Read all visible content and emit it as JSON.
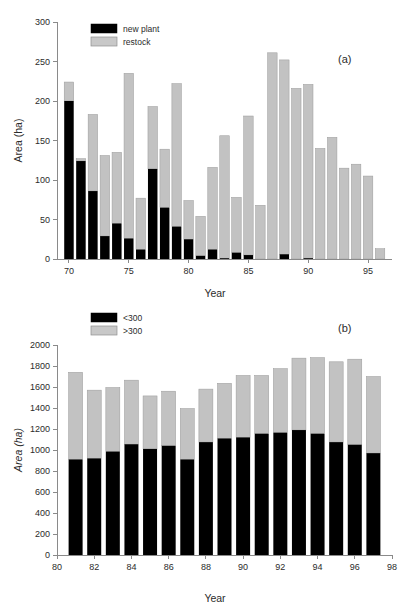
{
  "figure": {
    "background": "#ffffff",
    "bar_dark_color": "#000000",
    "bar_light_color": "#c2c2c2",
    "axis_color": "#8a8a8a"
  },
  "panel_a": {
    "label": "(a)",
    "legend": [
      {
        "name": "new plant",
        "color": "#000000"
      },
      {
        "name": "restock",
        "color": "#c2c2c2"
      }
    ]
  },
  "panel_b": {
    "label": "(b)",
    "legend": [
      {
        "name": "<300",
        "color": "#000000"
      },
      {
        "name": ">300",
        "color": "#c2c2c2"
      }
    ]
  },
  "chart_data": [
    {
      "type": "bar",
      "id": "panel-a",
      "stacked": true,
      "title": "",
      "panel_label": "(a)",
      "xlabel": "Year",
      "ylabel": "Area (ha)",
      "ylim": [
        0,
        300
      ],
      "yticks": [
        0,
        50,
        100,
        150,
        200,
        250,
        300
      ],
      "ytick_labels": [
        "0",
        "50",
        "100",
        "150",
        "200",
        "250",
        "300"
      ],
      "xlim": [
        69,
        97
      ],
      "xticks": [
        70,
        75,
        80,
        85,
        90,
        95
      ],
      "xtick_labels": [
        "70",
        "75",
        "80",
        "85",
        "90",
        "95"
      ],
      "grid": false,
      "legend_position": "top-left",
      "categories": [
        70,
        71,
        72,
        73,
        74,
        75,
        76,
        77,
        78,
        79,
        80,
        81,
        82,
        83,
        84,
        85,
        86,
        87,
        88,
        89,
        90,
        91,
        92,
        93,
        94,
        95,
        96
      ],
      "series": [
        {
          "name": "new plant",
          "color": "#000000",
          "values": [
            200,
            124,
            86,
            29,
            45,
            26,
            12,
            114,
            65,
            41,
            25,
            4,
            12,
            1,
            8,
            5,
            0,
            0,
            6,
            0,
            1,
            0,
            0,
            0,
            0,
            0,
            0
          ]
        },
        {
          "name": "restock",
          "color": "#c2c2c2",
          "values": [
            24,
            3,
            97,
            102,
            90,
            209,
            65,
            79,
            74,
            181,
            49,
            50,
            104,
            155,
            70,
            176,
            68,
            261,
            246,
            216,
            220,
            140,
            154,
            115,
            120,
            105,
            13
          ]
        }
      ],
      "totals": [
        224,
        127,
        183,
        131,
        135,
        235,
        77,
        193,
        139,
        222,
        74,
        54,
        116,
        156,
        78,
        181,
        68,
        261,
        252,
        216,
        221,
        140,
        154,
        115,
        120,
        105,
        13
      ]
    },
    {
      "type": "bar",
      "id": "panel-b",
      "stacked": true,
      "title": "",
      "panel_label": "(b)",
      "xlabel": "Year",
      "ylabel": "Area (ha)",
      "ylim": [
        0,
        2000
      ],
      "yticks": [
        0,
        200,
        400,
        600,
        800,
        1000,
        1200,
        1400,
        1600,
        1800,
        2000
      ],
      "ytick_labels": [
        "0",
        "200",
        "400",
        "600",
        "800",
        "1000",
        "1200",
        "1400",
        "1600",
        "1800",
        "2000"
      ],
      "xlim": [
        80,
        98
      ],
      "xticks": [
        80,
        82,
        84,
        86,
        88,
        90,
        92,
        94,
        96,
        98
      ],
      "xtick_labels": [
        "80",
        "82",
        "84",
        "86",
        "88",
        "90",
        "92",
        "94",
        "96",
        "98"
      ],
      "grid": false,
      "legend_position": "top-left",
      "categories": [
        81,
        82,
        83,
        84,
        85,
        86,
        87,
        88,
        89,
        90,
        91,
        92,
        93,
        94,
        95,
        96,
        97
      ],
      "series": [
        {
          "name": "<300",
          "color": "#000000",
          "values": [
            910,
            920,
            985,
            1055,
            1010,
            1040,
            910,
            1075,
            1110,
            1120,
            1155,
            1165,
            1190,
            1155,
            1075,
            1050,
            970
          ]
        },
        {
          "name": ">300",
          "color": "#c2c2c2",
          "values": [
            830,
            650,
            610,
            610,
            505,
            520,
            485,
            505,
            525,
            590,
            555,
            610,
            685,
            725,
            765,
            815,
            730
          ]
        }
      ],
      "totals": [
        1740,
        1570,
        1595,
        1665,
        1515,
        1560,
        1395,
        1580,
        1635,
        1710,
        1710,
        1775,
        1875,
        1880,
        1840,
        1865,
        1700
      ]
    }
  ]
}
